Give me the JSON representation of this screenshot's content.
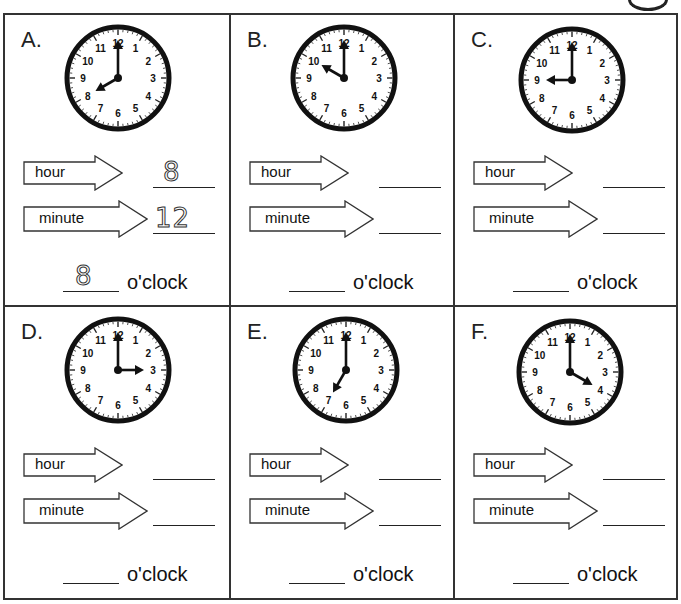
{
  "worksheet": {
    "page_badge_icon": "circled-number-icon",
    "labels": {
      "hour": "hour",
      "minute": "minute",
      "oclock": "o'clock"
    },
    "problems": [
      {
        "letter": "A.",
        "hour_hand": 8,
        "minute_hand": 12,
        "hour_answer": "8",
        "minute_answer": "12",
        "oclock_answer": "8"
      },
      {
        "letter": "B.",
        "hour_hand": 10,
        "minute_hand": 12,
        "hour_answer": "",
        "minute_answer": "",
        "oclock_answer": ""
      },
      {
        "letter": "C.",
        "hour_hand": 9,
        "minute_hand": 12,
        "hour_answer": "",
        "minute_answer": "",
        "oclock_answer": ""
      },
      {
        "letter": "D.",
        "hour_hand": 3,
        "minute_hand": 12,
        "hour_answer": "",
        "minute_answer": "",
        "oclock_answer": ""
      },
      {
        "letter": "E.",
        "hour_hand": 7,
        "minute_hand": 12,
        "hour_answer": "",
        "minute_answer": "",
        "oclock_answer": ""
      },
      {
        "letter": "F.",
        "hour_hand": 4,
        "minute_hand": 12,
        "hour_answer": "",
        "minute_answer": "",
        "oclock_answer": ""
      }
    ],
    "clock_numbers": [
      "12",
      "1",
      "2",
      "3",
      "4",
      "5",
      "6",
      "7",
      "8",
      "9",
      "10",
      "11"
    ],
    "colors": {
      "ink": "#111111",
      "border": "#333333",
      "paper": "#ffffff"
    }
  }
}
